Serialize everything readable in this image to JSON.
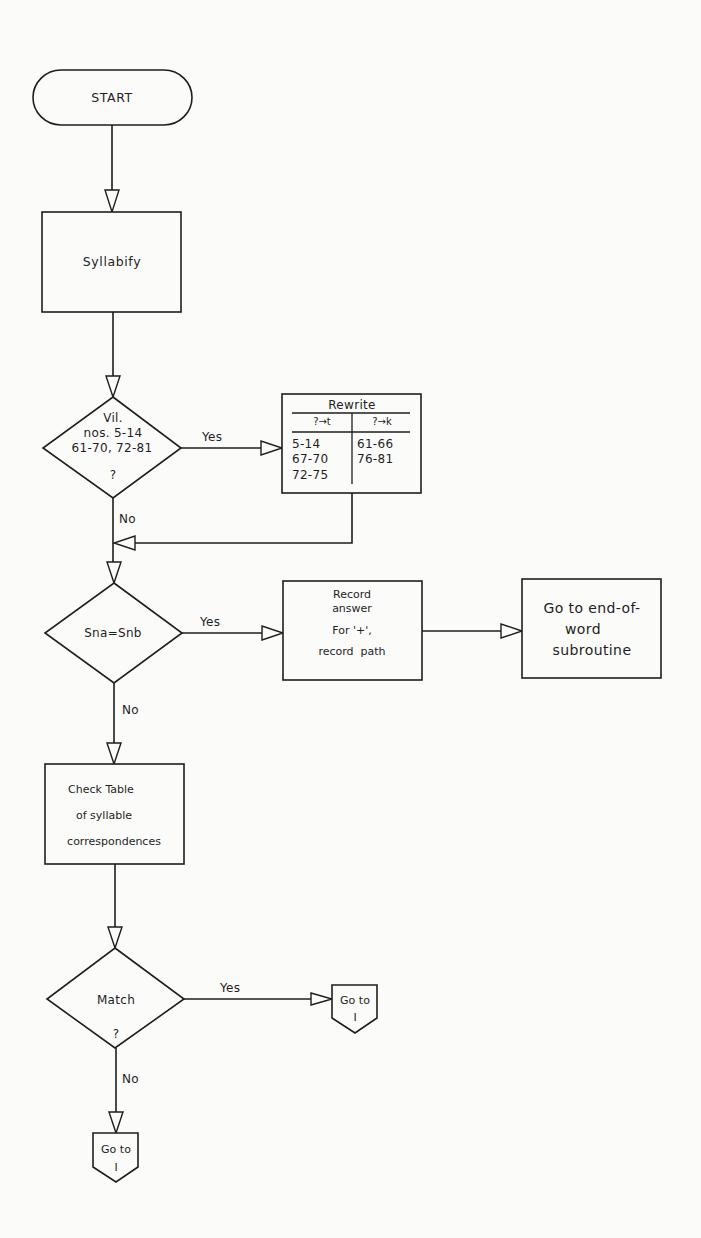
{
  "diagram": {
    "type": "flowchart",
    "nodes": {
      "start": {
        "shape": "terminator",
        "label": "START"
      },
      "syllabify": {
        "shape": "process",
        "label": "Syllabify"
      },
      "village_check": {
        "shape": "decision",
        "lines": [
          "Vil.",
          "nos. 5-14",
          "61-70, 72-81",
          "?"
        ]
      },
      "rewrite": {
        "shape": "process-table",
        "title": "Rewrite",
        "columns": [
          "?→t",
          "?→k"
        ],
        "rows": [
          [
            "5-14",
            "61-66"
          ],
          [
            "67-70",
            "76-81"
          ],
          [
            "72-75",
            ""
          ]
        ]
      },
      "sna_snb": {
        "shape": "decision",
        "label": "Sna=Snb"
      },
      "record_answer": {
        "shape": "process",
        "lines": [
          "Record",
          "answer",
          "For '+',",
          "record  path"
        ]
      },
      "end_of_word": {
        "shape": "process",
        "lines": [
          "Go to end-of-",
          "word",
          "subroutine"
        ]
      },
      "check_table": {
        "shape": "process",
        "lines": [
          "Check Table",
          "of syllable",
          "correspondences"
        ]
      },
      "match": {
        "shape": "decision",
        "lines": [
          "Match",
          "?"
        ]
      },
      "goto_yes": {
        "shape": "off-page-connector",
        "lines": [
          "Go to",
          "I"
        ]
      },
      "goto_no": {
        "shape": "off-page-connector",
        "lines": [
          "Go to",
          "I"
        ]
      }
    },
    "edge_labels": {
      "village_yes": "Yes",
      "village_no": "No",
      "sna_yes": "Yes",
      "sna_no": "No",
      "match_yes": "Yes",
      "match_no": "No"
    },
    "edges": [
      {
        "from": "start",
        "to": "syllabify"
      },
      {
        "from": "syllabify",
        "to": "village_check"
      },
      {
        "from": "village_check",
        "to": "rewrite",
        "label": "Yes"
      },
      {
        "from": "village_check",
        "to": "sna_snb",
        "label": "No"
      },
      {
        "from": "rewrite",
        "to": "sna_snb"
      },
      {
        "from": "sna_snb",
        "to": "record_answer",
        "label": "Yes"
      },
      {
        "from": "record_answer",
        "to": "end_of_word"
      },
      {
        "from": "sna_snb",
        "to": "check_table",
        "label": "No"
      },
      {
        "from": "check_table",
        "to": "match"
      },
      {
        "from": "match",
        "to": "goto_yes",
        "label": "Yes"
      },
      {
        "from": "match",
        "to": "goto_no",
        "label": "No"
      }
    ],
    "colors": {
      "ink": "#1e1e1e",
      "paper": "#fbfbfa"
    }
  }
}
